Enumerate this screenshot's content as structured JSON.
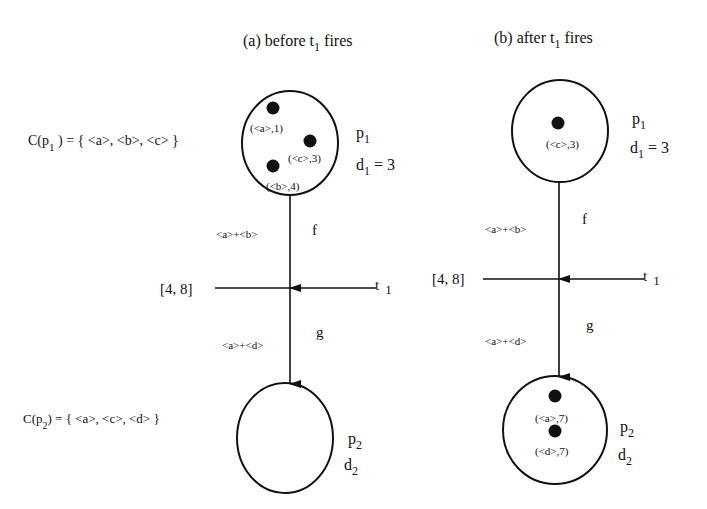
{
  "panels": {
    "a": {
      "title": "(a) before t",
      "title_sub": "1",
      "title_rest": " fires",
      "set_p1": {
        "prefix": "C(p",
        "sub": "1",
        "suffix": " ) = { <a>, <b>, <c> }"
      },
      "set_p2": {
        "prefix": "C(p",
        "sub": "2",
        "suffix": ") = { <a>, <c>, <d> }"
      },
      "p1_tokens": [
        {
          "label": "(<a>,1)"
        },
        {
          "label": "(<c>,3)"
        },
        {
          "label": "(<b>,4)"
        }
      ],
      "p1_name": "p",
      "p1_sub": "1",
      "d1_name": "d",
      "d1_sub": "1",
      "d1_val": " = 3",
      "arc_f_expr": "<a>+<b>",
      "arc_f_name": "f",
      "interval": "[4, 8]",
      "trans_name": "t",
      "trans_sub": "1",
      "arc_g_expr": "<a>+<d>",
      "arc_g_name": "g",
      "p2_name": "p",
      "p2_sub": "2",
      "d2_name": "d",
      "d2_sub": "2"
    },
    "b": {
      "title": "(b) after t",
      "title_sub": "1",
      "title_rest": " fires",
      "p1_tokens": [
        {
          "label": "(<c>,3)"
        }
      ],
      "p1_name": "p",
      "p1_sub": "1",
      "d1_name": "d",
      "d1_sub": "1",
      "d1_val": " = 3",
      "arc_f_expr": "<a>+<b>",
      "arc_f_name": "f",
      "interval": "[4, 8]",
      "trans_name": "t",
      "trans_sub": "1",
      "arc_g_expr": "<a>+<d>",
      "arc_g_name": "g",
      "p2_tokens": [
        {
          "label": "(<a>,7)"
        },
        {
          "label": "(<d>,7)"
        }
      ],
      "p2_name": "p",
      "p2_sub": "2",
      "d2_name": "d",
      "d2_sub": "2"
    }
  }
}
